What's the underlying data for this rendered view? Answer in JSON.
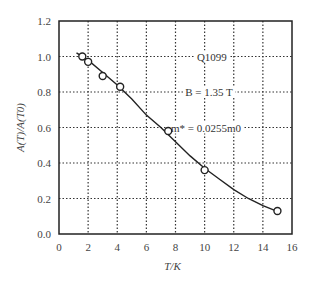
{
  "chart_data": {
    "type": "scatter",
    "title": "",
    "xlabel": "T/K",
    "ylabel": "A(T)/A(T0)",
    "xlim": [
      0,
      16
    ],
    "ylim": [
      0.0,
      1.2
    ],
    "xticks": [
      "0",
      "2",
      "4",
      "6",
      "8",
      "10",
      "12",
      "14",
      "16"
    ],
    "yticks": [
      "0.0",
      "0.2",
      "0.4",
      "0.6",
      "0.8",
      "1.0",
      "1.2"
    ],
    "grid": "dotted",
    "series": [
      {
        "name": "measured",
        "marker": "open-circle",
        "x": [
          1.6,
          2.0,
          3.0,
          4.2,
          7.5,
          10.0,
          15.0
        ],
        "y": [
          1.0,
          0.97,
          0.89,
          0.83,
          0.58,
          0.36,
          0.13
        ]
      },
      {
        "name": "fit",
        "style": "solid-line",
        "x": [
          1.2,
          2,
          3,
          4,
          5,
          6,
          7,
          8,
          9,
          10,
          11,
          12,
          13,
          14,
          15.2
        ],
        "y": [
          1.02,
          0.98,
          0.91,
          0.84,
          0.76,
          0.67,
          0.6,
          0.52,
          0.44,
          0.37,
          0.31,
          0.25,
          0.2,
          0.16,
          0.12
        ]
      }
    ],
    "annotations": [
      "Q1099",
      "B = 1.35 T",
      "m* = 0.0255m0"
    ]
  }
}
